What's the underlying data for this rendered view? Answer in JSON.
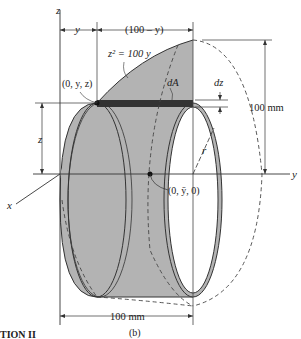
{
  "figure": {
    "caption": "(b)",
    "partial_heading": "TION II"
  },
  "axes": {
    "z_label": "z",
    "y_label": "y",
    "x_label": "x"
  },
  "labels": {
    "equation": "z² = 100 y",
    "point_top": "(0, y, z)",
    "centroid": "(0, ȳ, 0)",
    "dA": "dA",
    "dz": "dz",
    "r": "r",
    "z_dim": "z"
  },
  "dimensions": {
    "y_dim": "y",
    "remaining_dim": "(100 – y)",
    "height_dim": "100 mm",
    "length_dim": "100 mm"
  },
  "colors": {
    "fill_gray": "#b3b3b3",
    "strip_dark": "#333333",
    "line": "#333333"
  }
}
